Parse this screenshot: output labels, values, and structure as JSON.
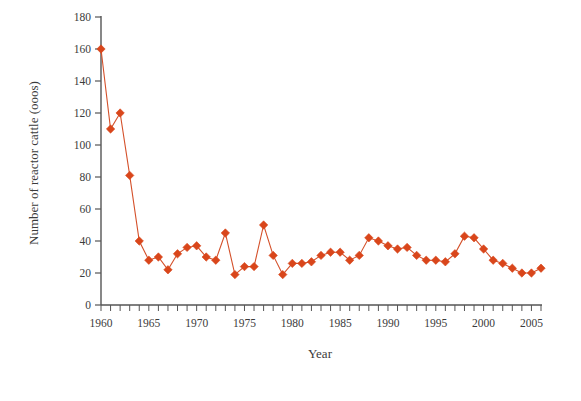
{
  "chart_data": {
    "type": "line",
    "title": "",
    "xlabel": "Year",
    "ylabel": "Number of reactor cattle (ooos)",
    "xlim": [
      1959,
      2006
    ],
    "ylim": [
      0,
      180
    ],
    "ytick_step": 20,
    "xtick_step": 5,
    "xtick_minor_step": 1,
    "grid": false,
    "legend": null,
    "marker": "diamond",
    "series_color": "#d9461b",
    "line_color": "#d4502a",
    "yticks": [
      0,
      20,
      40,
      60,
      80,
      100,
      120,
      140,
      160,
      180
    ],
    "ytick_labels": [
      "0",
      "20",
      "40",
      "60",
      "80",
      "100",
      "120",
      "140",
      "160",
      "180"
    ],
    "xticks": [
      1960,
      1965,
      1970,
      1975,
      1980,
      1985,
      1990,
      1995,
      2000,
      2005
    ],
    "xtick_labels": [
      "1960",
      "1965",
      "1970",
      "1975",
      "1980",
      "1985",
      "1990",
      "1995",
      "2000",
      "2005"
    ],
    "x": [
      1960,
      1961,
      1962,
      1963,
      1964,
      1965,
      1966,
      1967,
      1968,
      1969,
      1970,
      1971,
      1972,
      1973,
      1974,
      1975,
      1976,
      1977,
      1978,
      1979,
      1980,
      1981,
      1982,
      1983,
      1984,
      1985,
      1986,
      1987,
      1988,
      1989,
      1990,
      1991,
      1992,
      1993,
      1994,
      1995,
      1996,
      1997,
      1998,
      1999,
      2000,
      2001,
      2002,
      2003,
      2004,
      2005,
      2006
    ],
    "values": [
      160,
      110,
      120,
      81,
      40,
      28,
      30,
      22,
      32,
      36,
      37,
      30,
      28,
      45,
      19,
      24,
      24,
      50,
      31,
      19,
      26,
      26,
      27,
      31,
      33,
      33,
      28,
      31,
      42,
      40,
      37,
      35,
      36,
      31,
      28,
      28,
      27,
      32,
      43,
      42,
      35,
      28,
      26,
      23,
      20,
      20,
      23
    ]
  },
  "axis": {
    "y_title": "Number of reactor cattle (ooos)",
    "x_title": "Year"
  }
}
